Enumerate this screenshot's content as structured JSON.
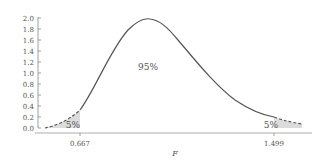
{
  "chart_data": {
    "type": "area",
    "title": "",
    "xlabel": "F",
    "ylabel": "",
    "ylim": [
      0.0,
      2.0
    ],
    "yticks": [
      "0.0",
      "0.2",
      "0.4",
      "0.6",
      "0.8",
      "1.0",
      "1.2",
      "1.4",
      "1.6",
      "1.8",
      "2.0"
    ],
    "xticks": [
      "0.667",
      "1.499"
    ],
    "critical_values": {
      "lower": 0.667,
      "upper": 1.499
    },
    "regions": [
      {
        "name": "lower tail",
        "label": "5%",
        "shaded": true
      },
      {
        "name": "center",
        "label": "95%",
        "shaded": false
      },
      {
        "name": "upper tail",
        "label": "5%",
        "shaded": true
      }
    ],
    "curve": {
      "description": "F distribution density, peak approx 1.98 near F≈1.0",
      "x": [
        0.5,
        0.6,
        0.667,
        0.8,
        0.9,
        1.0,
        1.1,
        1.2,
        1.3,
        1.4,
        1.499,
        1.6
      ],
      "y": [
        0.05,
        0.22,
        0.4,
        1.15,
        1.7,
        1.98,
        1.8,
        1.3,
        0.8,
        0.42,
        0.22,
        0.12
      ]
    },
    "grid": false,
    "legend": null
  },
  "labels": {
    "center_pct": "95%",
    "lower_pct": "5%",
    "upper_pct": "5%",
    "lower_crit": "0.667",
    "upper_crit": "1.499",
    "x_axis_title": "F"
  },
  "yaxis": {
    "ticks": [
      "0.0",
      "0.2",
      "0.4",
      "0.6",
      "0.8",
      "1.0",
      "1.2",
      "1.4",
      "1.6",
      "1.8",
      "2.0"
    ]
  },
  "colors": {
    "curve": "#555555",
    "shade": "#dcdcdc",
    "axis": "#888888",
    "text": "#555555"
  }
}
